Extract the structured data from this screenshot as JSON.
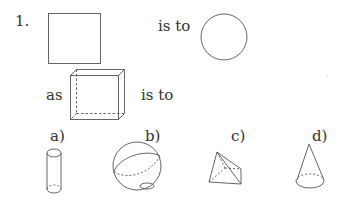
{
  "question": {
    "number": "1.",
    "is_to_1": "is to",
    "as": "as",
    "is_to_2": "is to"
  },
  "options": [
    {
      "label": "a)",
      "shape": "cylinder"
    },
    {
      "label": "b)",
      "shape": "sphere"
    },
    {
      "label": "c)",
      "shape": "pyramid"
    },
    {
      "label": "d)",
      "shape": "cone"
    }
  ],
  "figures": {
    "first": "square",
    "second": "circle",
    "third": "cube"
  }
}
